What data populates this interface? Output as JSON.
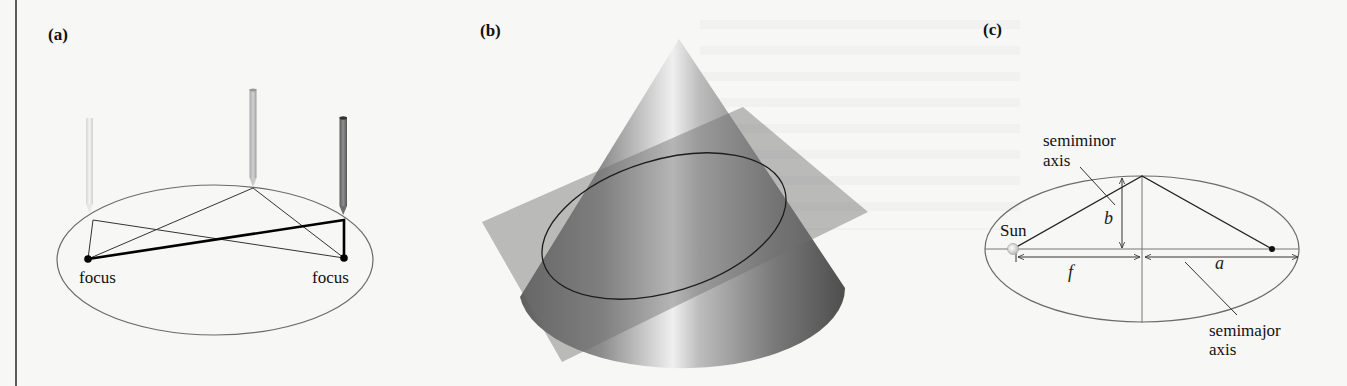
{
  "figure": {
    "panels": [
      {
        "id": "a",
        "label": "(a)",
        "description": "Drawing an ellipse with a string looped around two pinned foci and a pencil",
        "foci_labels": [
          "focus",
          "focus"
        ],
        "pencil_count": 3
      },
      {
        "id": "b",
        "label": "(b)",
        "description": "Ellipse formed by a plane slicing a cone at an angle"
      },
      {
        "id": "c",
        "label": "(c)",
        "description": "Orbital ellipse geometry with the Sun at one focus",
        "labels": {
          "semiminor_line1": "semiminor",
          "semiminor_line2": "axis",
          "semimajor_line1": "semimajor",
          "semimajor_line2": "axis",
          "sun": "Sun",
          "b": "b",
          "f": "f",
          "a": "a"
        }
      }
    ]
  },
  "colors": {
    "background": "#f7f7f6",
    "ink": "#111111",
    "ellipse_stroke": "#6a6a6a",
    "pencil_light": "#e2e2e2",
    "pencil_mid": "#bcbcbc",
    "pencil_dark": "#7a7a7a",
    "cone_dark": "#5e5e5e",
    "cone_light": "#e6e6e6",
    "plane": "#8a8a8a"
  }
}
